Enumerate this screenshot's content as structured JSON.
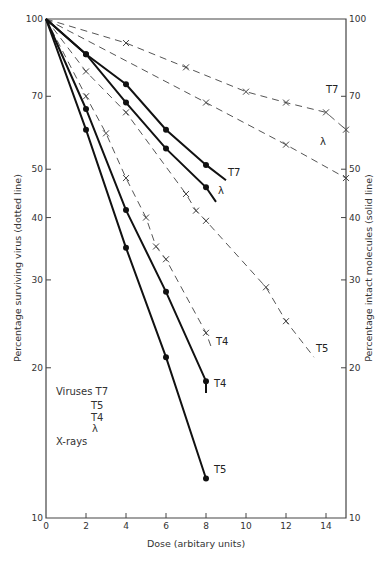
{
  "chart_data": {
    "type": "line",
    "title": "",
    "xlabel": "Dose (arbitary units)",
    "ylabel_left": "Percentage surviving virus (dotted line)",
    "ylabel_right": "Percentage intact molecules (solid line)",
    "xlim": [
      0,
      15
    ],
    "ylim": [
      10,
      100
    ],
    "yscale": "log",
    "grid": false,
    "x_ticks": [
      0,
      2,
      4,
      6,
      8,
      10,
      12,
      14
    ],
    "y_ticks_left": [
      10,
      20,
      30,
      40,
      50,
      70,
      100
    ],
    "y_ticks_right": [
      10,
      20,
      30,
      40,
      50,
      70,
      100
    ],
    "legend": {
      "lines": [
        "Viruses T7",
        "T5",
        "T4",
        "λ",
        "X-rays"
      ]
    },
    "series": [
      {
        "name": "T7 virus (dashed)",
        "style": "dashed",
        "marker": "x",
        "label": "T7",
        "points": [
          [
            0,
            100
          ],
          [
            4,
            89.5
          ],
          [
            7,
            80
          ],
          [
            10,
            71.5
          ],
          [
            12,
            68
          ],
          [
            14,
            65
          ],
          [
            15,
            60
          ]
        ],
        "end": [
          15,
          60
        ],
        "label_pos": [
          14,
          71
        ]
      },
      {
        "name": "λ virus (dashed)",
        "style": "dashed",
        "marker": "x",
        "label": "λ",
        "points": [
          [
            0,
            100
          ],
          [
            8,
            68
          ],
          [
            12,
            56
          ],
          [
            15,
            48
          ]
        ],
        "end": [
          15,
          48
        ],
        "label_pos": [
          13.7,
          56
        ]
      },
      {
        "name": "T5 virus (dashed)",
        "style": "dashed",
        "marker": "x",
        "label": "T5",
        "points": [
          [
            0,
            100
          ],
          [
            2,
            78.5
          ],
          [
            4,
            65
          ],
          [
            7,
            44.6
          ],
          [
            7.5,
            41.3
          ],
          [
            8,
            39.4
          ],
          [
            11,
            29
          ],
          [
            12,
            24.8
          ]
        ],
        "end": [
          13.4,
          21
        ],
        "label_pos": [
          13.5,
          21.5
        ]
      },
      {
        "name": "T4 virus (dashed)",
        "style": "dashed",
        "marker": "x",
        "label": "T4",
        "points": [
          [
            0,
            100
          ],
          [
            2,
            70
          ],
          [
            3,
            59
          ],
          [
            4,
            48
          ],
          [
            5,
            40
          ],
          [
            5.5,
            35
          ],
          [
            6,
            33
          ],
          [
            8,
            23.5
          ]
        ],
        "end": [
          8.3,
          21.8
        ],
        "label_pos": [
          8.5,
          22.2
        ]
      },
      {
        "name": "T7 molecules (solid)",
        "style": "solid",
        "marker": "dot",
        "label": "T7",
        "points": [
          [
            0,
            100
          ],
          [
            2,
            85
          ],
          [
            4,
            74
          ],
          [
            6,
            60
          ],
          [
            8,
            51
          ]
        ],
        "end": [
          9,
          47.5
        ],
        "label_pos": [
          9.1,
          48.5
        ]
      },
      {
        "name": "λ molecules (solid)",
        "style": "solid",
        "marker": "dot",
        "label": "λ",
        "points": [
          [
            0,
            100
          ],
          [
            2,
            85
          ],
          [
            4,
            68
          ],
          [
            6,
            55
          ],
          [
            8,
            46
          ]
        ],
        "end": [
          8.5,
          43
        ],
        "label_pos": [
          8.6,
          44.5
        ]
      },
      {
        "name": "T4 molecules (solid)",
        "style": "solid",
        "marker": "dot",
        "label": "T4",
        "points": [
          [
            0,
            100
          ],
          [
            2,
            66
          ],
          [
            4,
            41.4
          ],
          [
            6,
            28.4
          ],
          [
            8,
            18.8
          ]
        ],
        "end": [
          8,
          17.8
        ],
        "label_pos": [
          8.4,
          18.3
        ]
      },
      {
        "name": "T5 molecules (solid)",
        "style": "solid",
        "marker": "dot",
        "label": "T5",
        "points": [
          [
            0,
            100
          ],
          [
            2,
            60
          ],
          [
            4,
            34.8
          ],
          [
            6,
            21
          ],
          [
            8,
            12
          ]
        ],
        "end": [
          8,
          12
        ],
        "label_pos": [
          8.4,
          12.3
        ]
      }
    ]
  }
}
